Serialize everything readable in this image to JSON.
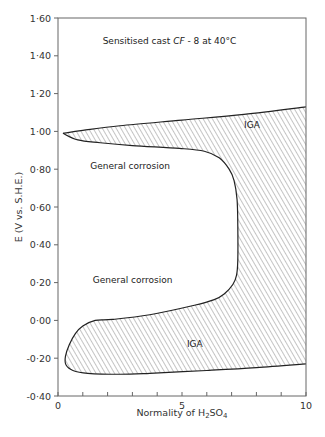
{
  "chart_data": {
    "type": "area",
    "xlabel": "Normality of H2SO4",
    "xlabel_parts": {
      "pre": "Normality of  H",
      "sub": "2",
      "post": "SO",
      "sub2": "4"
    },
    "ylabel": "E (V vs. S.H.E.)",
    "xlim": [
      0,
      10
    ],
    "ylim": [
      -0.4,
      1.6
    ],
    "x_ticks": [
      0,
      1,
      2,
      3,
      4,
      5,
      6,
      7,
      8,
      9,
      10
    ],
    "x_tick_labels": [
      {
        "value": 0,
        "label": "0"
      },
      {
        "value": 5,
        "label": "5"
      },
      {
        "value": 10,
        "label": "10"
      }
    ],
    "y_ticks": [
      1.6,
      1.4,
      1.2,
      1.0,
      0.8,
      0.6,
      0.4,
      0.2,
      0.0,
      -0.2,
      -0.4
    ],
    "y_tick_labels": [
      "1·60",
      "1·40",
      "1·20",
      "1·00",
      "0·80",
      "0·60",
      "0·40",
      "0·20",
      "0·00",
      "-0·20",
      "-0·40"
    ],
    "grid": false,
    "region": {
      "name": "IGA",
      "fill": "hatched",
      "upper_boundary": [
        [
          0.2,
          0.99
        ],
        [
          1.0,
          1.005
        ],
        [
          2.5,
          1.03
        ],
        [
          5.0,
          1.06
        ],
        [
          7.5,
          1.09
        ],
        [
          10.0,
          1.13
        ]
      ],
      "inner_boundary": [
        [
          0.2,
          0.99
        ],
        [
          0.8,
          0.955
        ],
        [
          1.7,
          0.94
        ],
        [
          3.0,
          0.925
        ],
        [
          4.9,
          0.91
        ],
        [
          5.9,
          0.895
        ],
        [
          6.5,
          0.86
        ],
        [
          6.9,
          0.8
        ],
        [
          7.1,
          0.74
        ],
        [
          7.22,
          0.64
        ],
        [
          7.25,
          0.5
        ],
        [
          7.25,
          0.32
        ],
        [
          7.2,
          0.24
        ],
        [
          7.05,
          0.19
        ],
        [
          6.7,
          0.14
        ],
        [
          6.3,
          0.11
        ],
        [
          5.5,
          0.08
        ],
        [
          3.7,
          0.03
        ],
        [
          2.2,
          0.005
        ],
        [
          1.5,
          0.0
        ],
        [
          1.0,
          -0.03
        ],
        [
          0.7,
          -0.07
        ],
        [
          0.45,
          -0.13
        ],
        [
          0.3,
          -0.19
        ],
        [
          0.32,
          -0.235
        ],
        [
          0.6,
          -0.265
        ],
        [
          1.2,
          -0.28
        ],
        [
          2.5,
          -0.285
        ],
        [
          3.7,
          -0.28
        ],
        [
          6.0,
          -0.265
        ],
        [
          8.0,
          -0.25
        ],
        [
          10.0,
          -0.23
        ]
      ]
    },
    "annotations": [
      {
        "text": "Sensitised cast",
        "italic_part": "CF",
        "rest": "- 8 at  40°C",
        "x": 1.8,
        "y": 1.46
      },
      {
        "text": "IGA",
        "x": 7.5,
        "y": 1.02
      },
      {
        "text": "General corrosion",
        "x": 1.3,
        "y": 0.8
      },
      {
        "text": "General corrosion",
        "x": 1.4,
        "y": 0.2
      },
      {
        "text": "IGA",
        "x": 5.2,
        "y": -0.14
      }
    ]
  }
}
